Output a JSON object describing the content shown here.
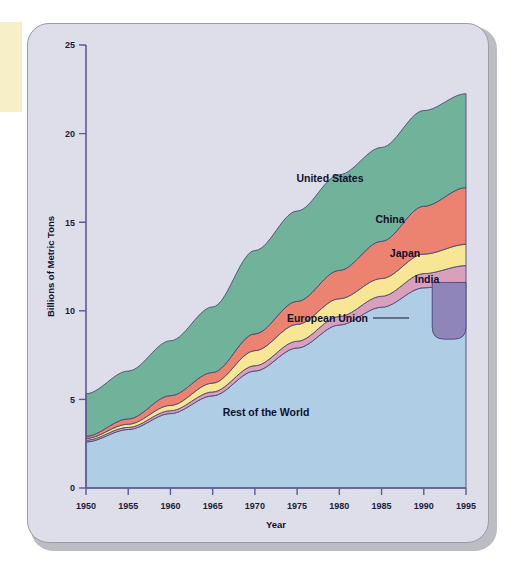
{
  "figure": {
    "card_background": "#dedeea",
    "edge_strip_color": "#f6efc8",
    "border_color": "#9a9aa8"
  },
  "chart_data": {
    "type": "area",
    "stacked": true,
    "title": "",
    "xlabel": "Year",
    "ylabel": "Billions of Metric Tons",
    "xlim": [
      1950,
      1995
    ],
    "ylim": [
      0,
      25
    ],
    "xticks": [
      1950,
      1955,
      1960,
      1965,
      1970,
      1975,
      1980,
      1985,
      1990,
      1995
    ],
    "yticks": [
      0,
      5,
      10,
      15,
      20,
      25
    ],
    "grid": false,
    "legend_position": "inline-labels",
    "x": [
      1950,
      1955,
      1960,
      1965,
      1970,
      1975,
      1980,
      1985,
      1990,
      1995
    ],
    "series": [
      {
        "name": "Rest of the World",
        "color": "#afcde4",
        "label": "Rest of the World",
        "values": [
          2.6,
          3.3,
          4.2,
          5.2,
          6.6,
          7.9,
          9.2,
          10.2,
          11.3,
          11.6
        ]
      },
      {
        "name": "India",
        "color": "#d9a0bd",
        "label": "India",
        "values": [
          0.1,
          0.12,
          0.16,
          0.22,
          0.3,
          0.38,
          0.48,
          0.62,
          0.8,
          0.95
        ]
      },
      {
        "name": "Japan",
        "color": "#f7e694",
        "label": "Japan",
        "values": [
          0.1,
          0.18,
          0.3,
          0.5,
          0.85,
          0.95,
          1.0,
          1.0,
          1.1,
          1.2
        ]
      },
      {
        "name": "China",
        "color": "#eb8370",
        "label": "China",
        "values": [
          0.12,
          0.3,
          0.55,
          0.6,
          0.95,
          1.3,
          1.6,
          2.1,
          2.7,
          3.2
        ]
      },
      {
        "name": "United States",
        "color": "#71b39a",
        "label": "United States",
        "values": [
          2.4,
          2.7,
          3.1,
          3.7,
          4.7,
          5.1,
          5.4,
          5.3,
          5.4,
          5.3
        ]
      }
    ],
    "european_union": {
      "name": "European Union",
      "label": "European Union",
      "color": "#8f85b8",
      "x_start": 1991,
      "x_end": 1995,
      "y_top": 11.6,
      "y_bottom": 8.4,
      "note": "shown as a separate purple band overlay at the right edge"
    },
    "totals": [
      5.32,
      6.6,
      8.31,
      10.22,
      13.4,
      15.63,
      17.68,
      19.22,
      21.3,
      22.25
    ]
  },
  "labels": {
    "united_states": "United States",
    "china": "China",
    "japan": "Japan",
    "india": "India",
    "european_union": "European Union",
    "rest_of_world": "Rest of the World",
    "x_axis": "Year",
    "y_axis": "Billions of Metric Tons"
  },
  "ticks": {
    "y": [
      "25",
      "20",
      "15",
      "10",
      "5",
      "0"
    ],
    "x": [
      "1950",
      "1955",
      "1960",
      "1965",
      "1970",
      "1975",
      "1980",
      "1985",
      "1990",
      "1995"
    ]
  }
}
